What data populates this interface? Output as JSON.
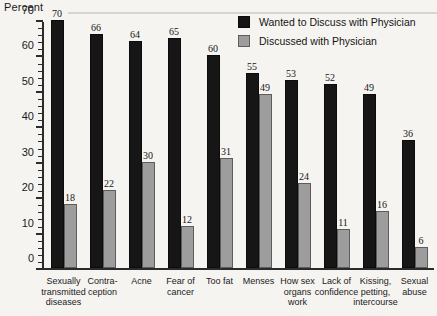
{
  "chart_data": {
    "type": "bar",
    "title": "",
    "subtitle": "",
    "xlabel": "",
    "ylabel": "Percent",
    "ylim": [
      0,
      70
    ],
    "ytick_step": 10,
    "yminor_step": 2,
    "grid": false,
    "legend_position": "top-right",
    "categories": [
      "Sexually transmitted diseases",
      "Contra-ception",
      "Acne",
      "Fear of cancer",
      "Too fat",
      "Menses",
      "How sex organs work",
      "Lack of confidence",
      "Kissing, petting, intercourse",
      "Sexual abuse"
    ],
    "category_lines": [
      [
        "Sexually",
        "transmitted",
        "diseases"
      ],
      [
        "Contra-",
        "ception"
      ],
      [
        "Acne"
      ],
      [
        "Fear of",
        "cancer"
      ],
      [
        "Too fat"
      ],
      [
        "Menses"
      ],
      [
        "How sex",
        "organs",
        "work"
      ],
      [
        "Lack of",
        "confidence"
      ],
      [
        "Kissing,",
        "petting,",
        "intercourse"
      ],
      [
        "Sexual",
        "abuse"
      ]
    ],
    "ytick_labels": [
      "0",
      "10",
      "20",
      "30",
      "40",
      "50",
      "60",
      "70"
    ],
    "series": [
      {
        "name": "Wanted to Discuss with Physician",
        "color": "#161616",
        "values": [
          70,
          66,
          64,
          65,
          60,
          55,
          53,
          52,
          49,
          36
        ]
      },
      {
        "name": "Discussed with Physician",
        "color": "#9d9d9d",
        "values": [
          18,
          22,
          30,
          12,
          31,
          49,
          24,
          11,
          16,
          6
        ]
      }
    ]
  },
  "axis": {
    "y_title": "Percent"
  },
  "legend": {
    "items": [
      {
        "label": "Wanted to Discuss with Physician",
        "swatch": "dark"
      },
      {
        "label": "Discussed with Physician",
        "swatch": "light"
      }
    ]
  }
}
